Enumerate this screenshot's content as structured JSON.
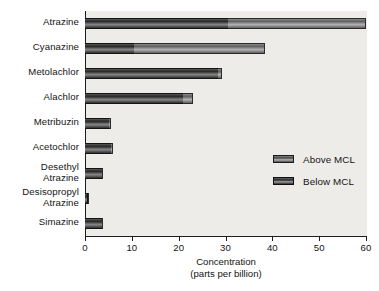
{
  "chart_data": {
    "type": "bar",
    "orientation": "horizontal",
    "stacked": true,
    "title": "",
    "xlabel": "Concentration\n(parts per billion)",
    "xlabel_line1": "Concentration",
    "xlabel_line2": "(parts per billion)",
    "ylabel": "",
    "xlim": [
      0,
      60
    ],
    "xticks": [
      0,
      10,
      20,
      30,
      40,
      50,
      60
    ],
    "xticklabels": [
      "0",
      "10",
      "20",
      "30",
      "40",
      "50",
      "60"
    ],
    "grid": false,
    "legend_position": "center-right",
    "categories": [
      "Atrazine",
      "Cyanazine",
      "Metolachlor",
      "Alachlor",
      "Metribuzin",
      "Acetochlor",
      "Desethyl\nAtrazine",
      "Desisopropyl\nAtrazine",
      "Simazine"
    ],
    "series": [
      {
        "name": "Below MCL",
        "color": "#3a3a3a",
        "values": [
          30.5,
          10.5,
          28.5,
          21.0,
          5.2,
          5.5,
          3.6,
          0.7,
          3.6
        ]
      },
      {
        "name": "Above MCL",
        "color": "#8a8a8a",
        "values": [
          29.5,
          28.0,
          0.7,
          2.0,
          0.4,
          0.4,
          0.3,
          0.2,
          0.3
        ]
      }
    ],
    "totals": [
      60.0,
      38.5,
      29.2,
      23.0,
      5.6,
      5.9,
      3.9,
      0.9,
      3.9
    ],
    "legend": [
      {
        "label": "Above MCL",
        "swatch": "above"
      },
      {
        "label": "Below MCL",
        "swatch": "below"
      }
    ]
  },
  "colors": {
    "plot_background": "#eeece9",
    "figure_background": "#ffffff",
    "axis": "#1c1c1c",
    "text": "#141414",
    "below_mcl": "#3a3a3a",
    "above_mcl": "#8a8a8a"
  }
}
